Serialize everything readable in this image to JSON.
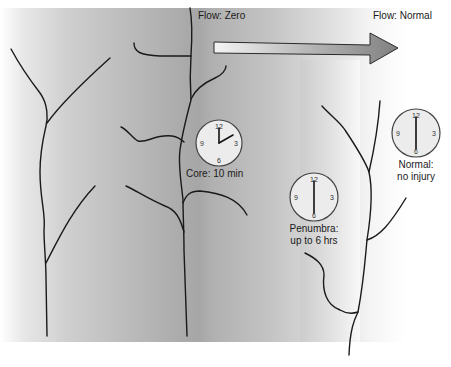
{
  "labels": {
    "flow_zero": "Flow: Zero",
    "flow_normal": "Flow: Normal",
    "core": "Core: 10 min",
    "penumbra_line1": "Penumbra:",
    "penumbra_line2": "up to 6 hrs",
    "normal_line1": "Normal:",
    "normal_line2": "no injury"
  },
  "clocks": [
    {
      "id": "core",
      "cx": 219,
      "cy": 143,
      "r": 23,
      "hour_angle": 0,
      "minute_angle": 60,
      "numbers": [
        "12",
        "3",
        "6",
        "9"
      ]
    },
    {
      "id": "penumbra",
      "cx": 314,
      "cy": 197,
      "r": 24,
      "hour_angle": 0,
      "minute_angle": 180,
      "numbers": [
        "12",
        "3",
        "6",
        "9"
      ]
    },
    {
      "id": "normal",
      "cx": 416,
      "cy": 133,
      "r": 24,
      "hour_angle": 0,
      "minute_angle": 180,
      "numbers": [
        "12",
        "3",
        "6",
        "9"
      ]
    }
  ],
  "colors": {
    "dark_gray": "#9a9a9a",
    "mid_gray": "#bdbdbd",
    "light_gray": "#e6e6e6",
    "white": "#ffffff",
    "arrow_start": "#f2f2f2",
    "arrow_end": "#8a8a8a",
    "line": "#1a1a1a"
  }
}
